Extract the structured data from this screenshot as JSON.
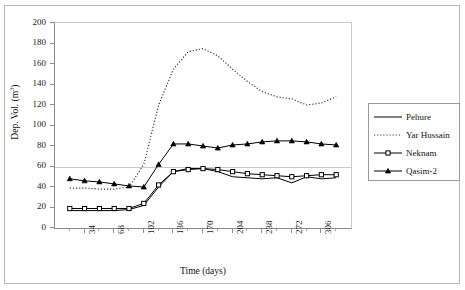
{
  "chart_data": {
    "type": "line",
    "title": "",
    "xlabel": "Time (days)",
    "ylabel": "Dep. Vol. (m3)",
    "ylabel_base": "Dep. Vol. (m",
    "ylabel_sup": "3",
    "ylabel_tail": ")",
    "xlim": [
      0,
      340
    ],
    "ylim": [
      0,
      200
    ],
    "grid": "horizontal-at-60",
    "legend_position": "right-outside",
    "y_ticks": [
      0,
      20,
      40,
      60,
      80,
      100,
      120,
      140,
      160,
      180,
      200
    ],
    "y_tick_labels": [
      "0",
      "20",
      "40",
      "60",
      "80",
      "100",
      "120",
      "140",
      "160",
      "180",
      "200"
    ],
    "x_ticks": [
      34,
      68,
      102,
      136,
      170,
      204,
      238,
      272,
      306
    ],
    "x_tick_labels": [
      "34",
      "68",
      "102",
      "136",
      "170",
      "204",
      "238",
      "272",
      "306"
    ],
    "x_minor_step": 17,
    "x": [
      17,
      34,
      51,
      68,
      85,
      102,
      119,
      136,
      153,
      170,
      187,
      204,
      221,
      238,
      255,
      272,
      289,
      306,
      323
    ],
    "series": [
      {
        "name": "Pehure",
        "style": "solid",
        "marker": "none",
        "color": "#000000",
        "values": [
          17,
          17,
          17,
          17,
          18,
          22,
          40,
          55,
          58,
          58,
          55,
          50,
          49,
          48,
          49,
          44,
          50,
          48,
          49
        ]
      },
      {
        "name": "Yar Hussain",
        "style": "dotted",
        "marker": "none",
        "color": "#3a3a3a",
        "values": [
          39,
          39,
          38,
          38,
          40,
          62,
          120,
          155,
          172,
          175,
          168,
          155,
          143,
          133,
          128,
          126,
          120,
          122,
          128
        ]
      },
      {
        "name": "Neknam",
        "style": "solid",
        "marker": "square",
        "color": "#000000",
        "values": [
          19,
          19,
          19,
          19,
          19,
          24,
          42,
          55,
          57,
          58,
          57,
          55,
          53,
          52,
          51,
          50,
          51,
          52,
          52
        ]
      },
      {
        "name": "Qasim-2",
        "style": "solid",
        "marker": "triangle",
        "color": "#000000",
        "values": [
          48,
          46,
          45,
          43,
          41,
          40,
          62,
          82,
          82,
          80,
          78,
          81,
          82,
          84,
          85,
          85,
          84,
          82,
          81
        ]
      }
    ]
  },
  "legend": {
    "entries": [
      {
        "label": "Pehure",
        "sample": "solid-line"
      },
      {
        "label": "Yar Hussain",
        "sample": "dotted-line"
      },
      {
        "label": "Neknam",
        "sample": "line-square-marker"
      },
      {
        "label": "Qasim-2",
        "sample": "line-triangle-marker"
      }
    ]
  }
}
